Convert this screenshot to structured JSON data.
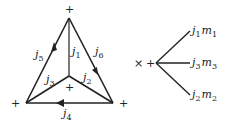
{
  "diagram": {
    "triangle": {
      "vertex_signs": {
        "top": "+",
        "left": "+",
        "right": "+",
        "center": "+"
      },
      "edges": [
        {
          "id": "j1",
          "label": "j",
          "sub": "1",
          "from": "top",
          "to": "center",
          "arrow": false
        },
        {
          "id": "j2",
          "label": "j",
          "sub": "2",
          "from": "center",
          "to": "right",
          "arrow": false
        },
        {
          "id": "j3",
          "label": "j",
          "sub": "3",
          "from": "center",
          "to": "left",
          "arrow": false
        },
        {
          "id": "j4",
          "label": "j",
          "sub": "4",
          "from": "right",
          "to": "left",
          "arrow": true
        },
        {
          "id": "j5",
          "label": "j",
          "sub": "5",
          "from": "left",
          "to": "top",
          "arrow": true
        },
        {
          "id": "j6",
          "label": "j",
          "sub": "6",
          "from": "top",
          "to": "right",
          "arrow": true
        }
      ]
    },
    "times_symbol": "×",
    "vertex": {
      "sign": "+",
      "branches": [
        {
          "j": "j",
          "j_sub": "1",
          "m": "m",
          "m_sub": "1"
        },
        {
          "j": "j",
          "j_sub": "3",
          "m": "m",
          "m_sub": "3"
        },
        {
          "j": "j",
          "j_sub": "2",
          "m": "m",
          "m_sub": "2"
        }
      ]
    }
  }
}
